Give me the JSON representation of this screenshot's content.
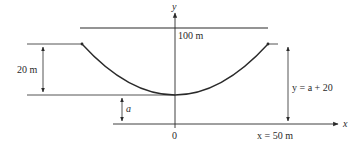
{
  "diagram": {
    "type": "hanging-cable-parabola",
    "labels": {
      "y_axis": "y",
      "x_axis": "x",
      "span": "100 m",
      "sag": "20 m",
      "offset": "a",
      "origin": "0",
      "right_height": "y = a + 20",
      "half_span": "x = 50 m"
    },
    "colors": {
      "line": "#2a2a2a",
      "background": "#ffffff"
    }
  }
}
